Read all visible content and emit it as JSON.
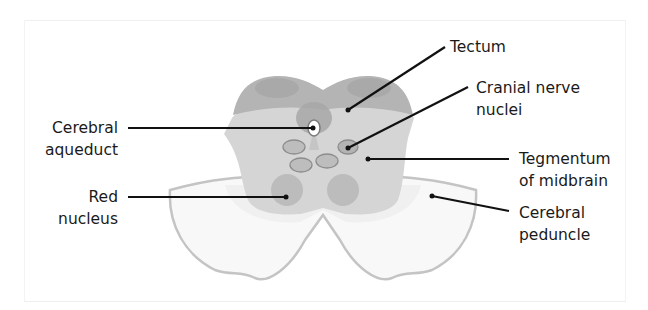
{
  "figure": {
    "labels": {
      "tectum": {
        "line1": "Tectum",
        "line2": ""
      },
      "cranial_nerve_nuclei": {
        "line1": "Cranial nerve",
        "line2": "nuclei"
      },
      "tegmentum": {
        "line1": "Tegmentum",
        "line2": "of midbrain"
      },
      "cerebral_peduncle": {
        "line1": "Cerebral",
        "line2": "peduncle"
      },
      "cerebral_aqueduct": {
        "line1": "Cerebral",
        "line2": "aqueduct"
      },
      "red_nucleus": {
        "line1": "Red",
        "line2": "nucleus"
      }
    },
    "colors": {
      "tectum": "#b5b5b5",
      "tegmentum": "#d4d4d4",
      "peduncle": "#f7f7f7",
      "peduncle_edge": "#c2c2c2",
      "nuclei_fill": "#b9b9b9",
      "nuclei_stroke": "#8e8e8e",
      "red_nucleus": "#bdbdbd",
      "leader_line": "#111111",
      "text": "#1a1a1a"
    }
  }
}
